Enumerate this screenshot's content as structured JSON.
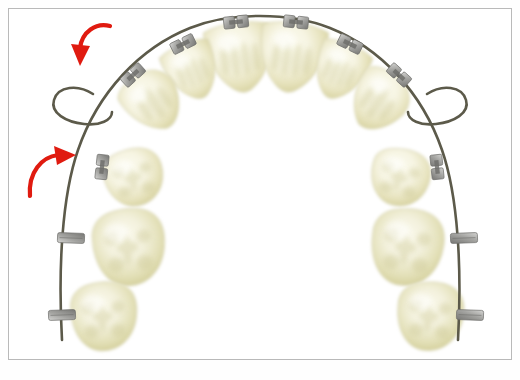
{
  "figure": {
    "title": "Orthodontic maxillary arch with bracketed teeth, archwire and bilateral teardrop loops",
    "type": "dental-illustration",
    "background_color": "#ffffff",
    "frame_color": "#b9b9b9",
    "arrow_color": "#e01b10",
    "wire_color": "#5c5a4a",
    "bracket_color": "#9a9a97",
    "bracket_stroke": "#6e6e6b",
    "tooth_fill": "#f4f2de",
    "tooth_shade": "#ccc894",
    "tooth_stroke": "#d8d5b4"
  },
  "arrows": [
    {
      "name": "upper-left-force-arrow",
      "label": "",
      "direction": "clockwise-down",
      "color": "#e01b10",
      "path": "M 110 26 C 96 22 82 32 80 48",
      "head": "M 80 66 L 71 44 L 90 46 Z"
    },
    {
      "name": "lower-left-force-arrow",
      "label": "",
      "direction": "counterclockwise-up",
      "color": "#e01b10",
      "path": "M 30 196 C 28 172 42 157 58 155",
      "head": "M 76 155 L 54 146 L 57 165 Z"
    }
  ],
  "archwire": {
    "name": "archwire",
    "color": "#5c5a4a",
    "width": 2.6,
    "main_path": "M 62 340 C 58 268 62 196 78 150 C 98 92 140 48 190 28 C 230 12 290 12 330 28 C 380 48 422 92 442 150 C 458 196 462 268 458 340",
    "loops": [
      {
        "name": "left-teardrop-loop",
        "path": "M 93 94 C 78 84 58 86 54 100 C 50 113 66 122 84 124 C 100 126 112 120 112 112"
      },
      {
        "name": "right-teardrop-loop",
        "path": "M 427 94 C 442 84 462 86 466 100 C 470 113 454 122 436 124 C 420 126 408 120 408 112"
      }
    ]
  },
  "teeth": [
    {
      "name": "tooth-upper-left-central-incisor",
      "position": "central-incisor-left",
      "cx": 240,
      "cy": 56,
      "rx": 33,
      "ry": 34,
      "rot": -8,
      "shape": "incisor"
    },
    {
      "name": "tooth-upper-right-central-incisor",
      "position": "central-incisor-right",
      "cx": 292,
      "cy": 56,
      "rx": 33,
      "ry": 34,
      "rot": 8,
      "shape": "incisor"
    },
    {
      "name": "tooth-upper-left-lateral-incisor",
      "position": "lateral-incisor-left",
      "cx": 192,
      "cy": 70,
      "rx": 26,
      "ry": 28,
      "rot": -22,
      "shape": "incisor"
    },
    {
      "name": "tooth-upper-right-lateral-incisor",
      "position": "lateral-incisor-right",
      "cx": 340,
      "cy": 70,
      "rx": 26,
      "ry": 28,
      "rot": 22,
      "shape": "incisor"
    },
    {
      "name": "tooth-upper-left-canine",
      "position": "canine-left",
      "cx": 153,
      "cy": 101,
      "rx": 28,
      "ry": 30,
      "rot": -34,
      "shape": "canine"
    },
    {
      "name": "tooth-upper-right-canine",
      "position": "canine-right",
      "cx": 379,
      "cy": 101,
      "rx": 28,
      "ry": 30,
      "rot": 34,
      "shape": "canine"
    },
    {
      "name": "tooth-upper-left-first-premolar",
      "position": "first-premolar-left",
      "cx": 134,
      "cy": 178,
      "rx": 30,
      "ry": 28,
      "rot": -12,
      "shape": "premolar"
    },
    {
      "name": "tooth-upper-right-first-premolar",
      "position": "first-premolar-right",
      "cx": 400,
      "cy": 178,
      "rx": 30,
      "ry": 28,
      "rot": 12,
      "shape": "premolar"
    },
    {
      "name": "tooth-upper-left-first-molar",
      "position": "first-molar-left",
      "cx": 129,
      "cy": 248,
      "rx": 36,
      "ry": 37,
      "rot": -6,
      "shape": "molar"
    },
    {
      "name": "tooth-upper-right-first-molar",
      "position": "first-molar-right",
      "cx": 407,
      "cy": 248,
      "rx": 36,
      "ry": 37,
      "rot": 6,
      "shape": "molar"
    },
    {
      "name": "tooth-upper-left-second-molar",
      "position": "second-molar-left",
      "cx": 104,
      "cy": 317,
      "rx": 33,
      "ry": 33,
      "rot": -4,
      "shape": "molar"
    },
    {
      "name": "tooth-upper-right-second-molar",
      "position": "second-molar-right",
      "cx": 430,
      "cy": 317,
      "rx": 33,
      "ry": 33,
      "rot": 4,
      "shape": "molar"
    }
  ],
  "brackets": [
    {
      "name": "bracket-upper-left-central-incisor",
      "x": 236,
      "y": 22,
      "rot": -6,
      "w": 11,
      "h": 12,
      "style": "twin"
    },
    {
      "name": "bracket-upper-right-central-incisor",
      "x": 296,
      "y": 22,
      "rot": 6,
      "w": 11,
      "h": 12,
      "style": "twin"
    },
    {
      "name": "bracket-upper-left-lateral-incisor",
      "x": 183,
      "y": 44,
      "rot": -26,
      "w": 11,
      "h": 12,
      "style": "twin"
    },
    {
      "name": "bracket-upper-right-lateral-incisor",
      "x": 350,
      "y": 44,
      "rot": 26,
      "w": 11,
      "h": 12,
      "style": "twin"
    },
    {
      "name": "bracket-upper-left-canine",
      "x": 133,
      "y": 75,
      "rot": -42,
      "w": 11,
      "h": 12,
      "style": "twin"
    },
    {
      "name": "bracket-upper-right-canine",
      "x": 399,
      "y": 75,
      "rot": 42,
      "w": 11,
      "h": 12,
      "style": "twin"
    },
    {
      "name": "bracket-upper-left-first-premolar",
      "x": 102,
      "y": 167,
      "rot": -84,
      "w": 11,
      "h": 12,
      "style": "twin"
    },
    {
      "name": "bracket-upper-right-first-premolar",
      "x": 437,
      "y": 167,
      "rot": 84,
      "w": 11,
      "h": 12,
      "style": "twin"
    },
    {
      "name": "tube-upper-left-first-molar",
      "x": 71,
      "y": 238,
      "rot": -88,
      "w": 10,
      "h": 27,
      "style": "tube"
    },
    {
      "name": "tube-upper-right-first-molar",
      "x": 464,
      "y": 238,
      "rot": 88,
      "w": 10,
      "h": 27,
      "style": "tube"
    },
    {
      "name": "tube-upper-left-second-molar",
      "x": 62,
      "y": 315,
      "rot": -92,
      "w": 10,
      "h": 27,
      "style": "tube"
    },
    {
      "name": "tube-upper-right-second-molar",
      "x": 470,
      "y": 315,
      "rot": 92,
      "w": 10,
      "h": 27,
      "style": "tube"
    }
  ]
}
